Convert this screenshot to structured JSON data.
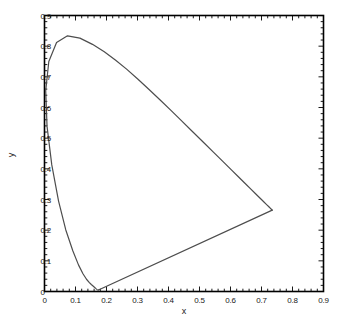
{
  "chart_data": {
    "type": "line",
    "title": "",
    "subtitle": "",
    "xlabel": "x",
    "ylabel": "y",
    "xlim": [
      0,
      0.9
    ],
    "ylim": [
      0,
      0.9
    ],
    "grid": false,
    "legend": null,
    "legend_position": "none",
    "x_ticks": [
      0,
      0.1,
      0.2,
      0.3,
      0.4,
      0.5,
      0.6,
      0.7,
      0.8,
      0.9
    ],
    "y_ticks": [
      0,
      0.1,
      0.2,
      0.3,
      0.4,
      0.5,
      0.6,
      0.7,
      0.8,
      0.9
    ],
    "x_tick_labels": [
      "0",
      "0.1",
      "0.2",
      "0.3",
      "0.4",
      "0.5",
      "0.6",
      "0.7",
      "0.8",
      "0.9"
    ],
    "y_tick_labels": [
      "0",
      "0.1",
      "0.2",
      "0.3",
      "0.4",
      "0.5",
      "0.6",
      "0.7",
      "0.8",
      "0.9"
    ],
    "minor_ticks_per_interval": 4,
    "line_color": "#4d4d4d",
    "line_width": 1.2,
    "axis_color": "#000000",
    "background_color": "#ffffff",
    "series": [
      {
        "name": "spectral-locus",
        "closed": false,
        "points": [
          [
            0.1741,
            0.005
          ],
          [
            0.174,
            0.005
          ],
          [
            0.1738,
            0.0049
          ],
          [
            0.1736,
            0.0049
          ],
          [
            0.1733,
            0.0048
          ],
          [
            0.173,
            0.0048
          ],
          [
            0.1726,
            0.0048
          ],
          [
            0.1721,
            0.0048
          ],
          [
            0.1714,
            0.0051
          ],
          [
            0.1703,
            0.0058
          ],
          [
            0.1689,
            0.0069
          ],
          [
            0.1669,
            0.0086
          ],
          [
            0.1644,
            0.0109
          ],
          [
            0.1611,
            0.0138
          ],
          [
            0.1566,
            0.0177
          ],
          [
            0.151,
            0.0227
          ],
          [
            0.144,
            0.0297
          ],
          [
            0.1355,
            0.0399
          ],
          [
            0.1241,
            0.0578
          ],
          [
            0.1096,
            0.0868
          ],
          [
            0.0913,
            0.1327
          ],
          [
            0.0687,
            0.2007
          ],
          [
            0.0454,
            0.295
          ],
          [
            0.0235,
            0.4127
          ],
          [
            0.0082,
            0.5384
          ],
          [
            0.0039,
            0.6548
          ],
          [
            0.0139,
            0.7502
          ],
          [
            0.0389,
            0.812
          ],
          [
            0.0743,
            0.8338
          ],
          [
            0.1142,
            0.8262
          ],
          [
            0.1547,
            0.8059
          ],
          [
            0.1929,
            0.7816
          ],
          [
            0.2296,
            0.7543
          ],
          [
            0.2658,
            0.7243
          ],
          [
            0.3016,
            0.6923
          ],
          [
            0.3373,
            0.6589
          ],
          [
            0.3731,
            0.6245
          ],
          [
            0.4087,
            0.5896
          ],
          [
            0.4441,
            0.5547
          ],
          [
            0.4788,
            0.5202
          ],
          [
            0.5125,
            0.4866
          ],
          [
            0.5448,
            0.4544
          ],
          [
            0.5752,
            0.4242
          ],
          [
            0.6029,
            0.3965
          ],
          [
            0.627,
            0.3725
          ],
          [
            0.6482,
            0.3514
          ],
          [
            0.6658,
            0.334
          ],
          [
            0.6801,
            0.3197
          ],
          [
            0.6915,
            0.3083
          ],
          [
            0.7006,
            0.2993
          ],
          [
            0.7079,
            0.292
          ],
          [
            0.714,
            0.2859
          ],
          [
            0.719,
            0.2809
          ],
          [
            0.723,
            0.277
          ],
          [
            0.726,
            0.274
          ],
          [
            0.7283,
            0.2717
          ],
          [
            0.73,
            0.27
          ],
          [
            0.7311,
            0.2689
          ],
          [
            0.732,
            0.268
          ],
          [
            0.7327,
            0.2673
          ],
          [
            0.7334,
            0.2666
          ],
          [
            0.734,
            0.266
          ],
          [
            0.7344,
            0.2656
          ],
          [
            0.7346,
            0.2654
          ],
          [
            0.7347,
            0.2653
          ]
        ]
      },
      {
        "name": "purple-line",
        "closed": false,
        "points": [
          [
            0.7347,
            0.2653
          ],
          [
            0.1741,
            0.005
          ]
        ]
      }
    ],
    "annotations": [
      {
        "label": "peak",
        "x": 0.0743,
        "y": 0.8338
      },
      {
        "label": "red-vertex",
        "x": 0.7347,
        "y": 0.2653
      },
      {
        "label": "violet-vertex",
        "x": 0.1741,
        "y": 0.005
      }
    ]
  },
  "axes": {
    "x_title": "x",
    "y_title": "y"
  }
}
